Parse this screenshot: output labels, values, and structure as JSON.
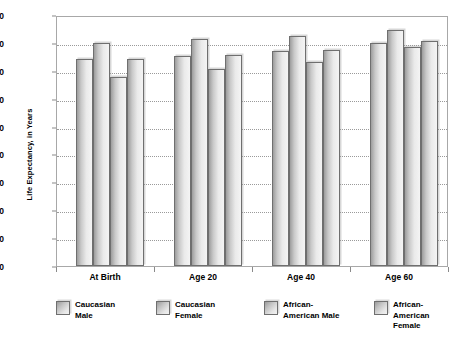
{
  "chart_data": {
    "type": "bar",
    "title": "",
    "xlabel": "",
    "ylabel": "Life Expectancy, in Years",
    "ylim": [
      0,
      90
    ],
    "ytick_step": 10,
    "yticks": [
      90,
      80,
      70,
      60,
      50,
      40,
      30,
      20,
      10,
      0
    ],
    "grid": true,
    "legend_position": "bottom",
    "categories": [
      "At Birth",
      "Age 20",
      "Age 40",
      "Age 60"
    ],
    "series": [
      {
        "name": "Caucasian\nMale",
        "values": [
          74.3,
          75.2,
          77.0,
          79.8
        ]
      },
      {
        "name": "Caucasian\nFemale",
        "values": [
          80.0,
          81.4,
          82.5,
          84.5
        ]
      },
      {
        "name": "African-\nAmerican Male",
        "values": [
          67.7,
          70.7,
          73.0,
          78.5
        ]
      },
      {
        "name": "African-\nAmerican Female",
        "values": [
          74.4,
          75.8,
          77.5,
          80.8
        ]
      }
    ],
    "colors": {
      "bar_fill_dark": "#9d9d9d",
      "bar_fill_light": "#f4f4f4",
      "bar_border": "#6f6f6f",
      "gridline": "#9a9a9a",
      "plot_border": "#a8a8a8",
      "background": "#ffffff",
      "text": "#000000"
    }
  },
  "legend": {
    "items": [
      {
        "label": "Caucasian\nMale"
      },
      {
        "label": "Caucasian\nFemale"
      },
      {
        "label": "African-\nAmerican Male"
      },
      {
        "label": "African-\nAmerican Female"
      }
    ]
  }
}
